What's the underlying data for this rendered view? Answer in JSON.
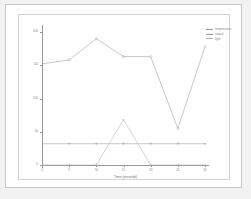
{
  "chart_data": {
    "type": "line",
    "title": "",
    "xlabel": "Time (seconds)",
    "ylabel": "",
    "x": [
      0,
      5,
      10,
      15,
      20,
      25,
      30
    ],
    "xtick_labels": [
      "0",
      "5",
      "10",
      "15",
      "20",
      "25",
      "30"
    ],
    "ytick_labels": [
      "200",
      "150",
      "100",
      "50",
      "0"
    ],
    "ytick_values": [
      200,
      150,
      100,
      50,
      0
    ],
    "xlim": [
      0,
      30
    ],
    "ylim": [
      0,
      200
    ],
    "grid": false,
    "legend_position": "top-right",
    "series": [
      {
        "name": "temperature",
        "color": "#9a9a9a",
        "marker": "diamond",
        "values": [
          152,
          158,
          190,
          163,
          163,
          55,
          178
        ]
      },
      {
        "name": "sound",
        "color": "#9a9a9a",
        "marker": "plus",
        "values": [
          32,
          32,
          32,
          32,
          32,
          32,
          32
        ]
      },
      {
        "name": "light",
        "color": "#b0b0b0",
        "marker": "plus",
        "values": [
          0,
          0,
          0,
          68,
          0,
          0,
          0
        ]
      }
    ]
  },
  "legend": {
    "items": [
      {
        "label": "temperature"
      },
      {
        "label": "sound"
      },
      {
        "label": "light"
      }
    ]
  },
  "axes": {
    "x_title": "Time (seconds)"
  }
}
